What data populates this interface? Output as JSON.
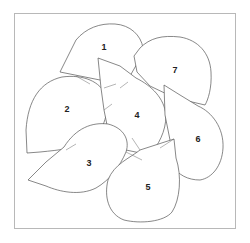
{
  "diagram": {
    "type": "numbered-shapes",
    "frame_color": "#b8b8b8",
    "stroke_color": "#555555",
    "shapes": [
      {
        "id": 1,
        "label": "1",
        "x": 104,
        "y": 47
      },
      {
        "id": 2,
        "label": "2",
        "x": 67,
        "y": 109
      },
      {
        "id": 3,
        "label": "3",
        "x": 89,
        "y": 163
      },
      {
        "id": 4,
        "label": "4",
        "x": 137,
        "y": 115
      },
      {
        "id": 5,
        "label": "5",
        "x": 148,
        "y": 187
      },
      {
        "id": 6,
        "label": "6",
        "x": 198,
        "y": 139
      },
      {
        "id": 7,
        "label": "7",
        "x": 175,
        "y": 70
      }
    ]
  }
}
